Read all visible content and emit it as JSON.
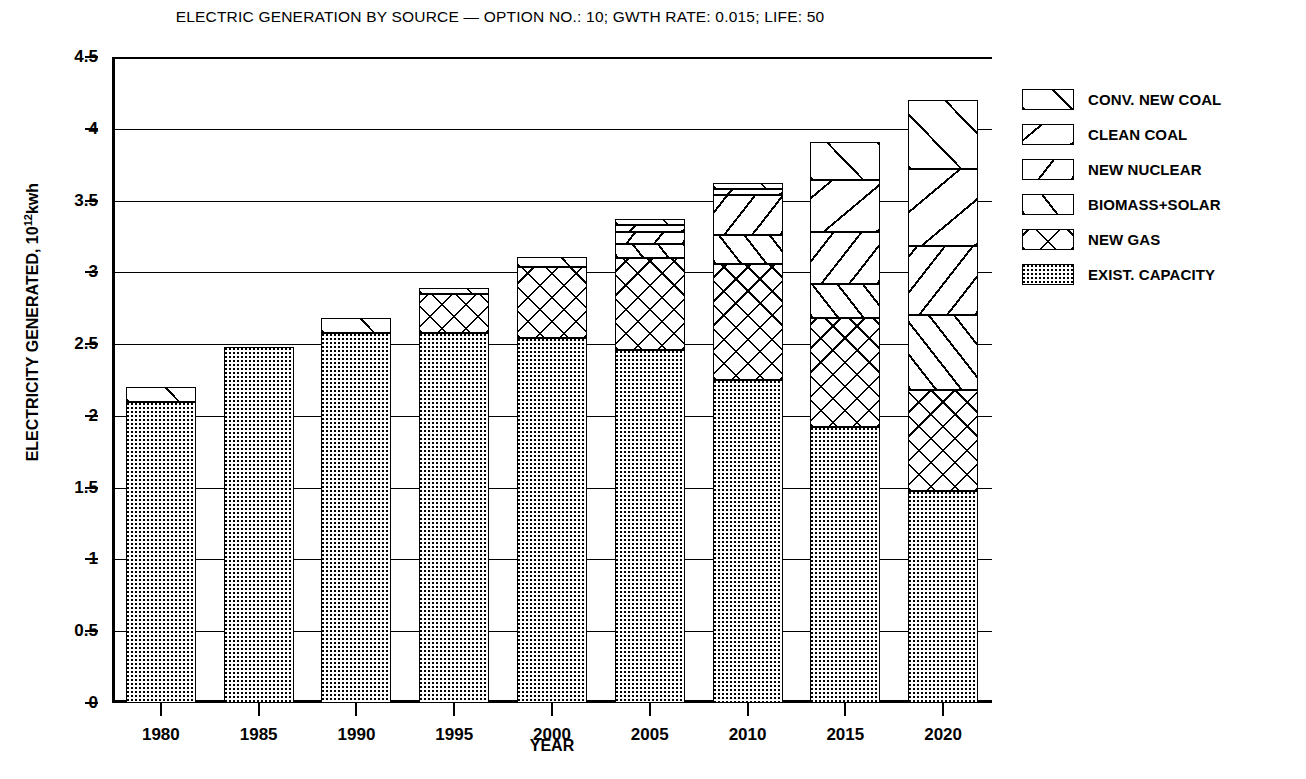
{
  "chart_data": {
    "type": "bar",
    "stacked": true,
    "title": "ELECTRIC GENERATION BY SOURCE — OPTION NO.: 10; GWTH RATE: 0.015; LIFE: 50",
    "xlabel": "YEAR",
    "ylabel": "ELECTRICITY GENERATED, 10¹12kwh",
    "ylabel_prefix": "ELECTRICITY GENERATED, 10",
    "ylabel_exponent": "12",
    "ylabel_suffix": "kwh",
    "categories": [
      "1980",
      "1985",
      "1990",
      "1995",
      "2000",
      "2005",
      "2010",
      "2015",
      "2020"
    ],
    "ylim": [
      0,
      4.5
    ],
    "ytick_labels": [
      "0",
      "0.5",
      "1",
      "1.5",
      "2",
      "2.5",
      "3",
      "3.5",
      "4",
      "4.5"
    ],
    "ytick_values": [
      0,
      0.5,
      1,
      1.5,
      2,
      2.5,
      3,
      3.5,
      4,
      4.5
    ],
    "grid": "horizontal",
    "legend_position": "right",
    "series": [
      {
        "name": "EXIST. CAPACITY",
        "fill": "dotted",
        "values": [
          2.1,
          2.48,
          2.58,
          2.58,
          2.54,
          2.46,
          2.25,
          1.92,
          1.48
        ]
      },
      {
        "name": "NEW GAS",
        "fill": "cross-hatch",
        "values": [
          0.0,
          0.0,
          0.0,
          0.27,
          0.5,
          0.64,
          0.81,
          0.76,
          0.7
        ]
      },
      {
        "name": "BIOMASS+SOLAR",
        "fill": "diagonal-up",
        "values": [
          0.0,
          0.0,
          0.0,
          0.0,
          0.0,
          0.1,
          0.2,
          0.24,
          0.52
        ]
      },
      {
        "name": "NEW NUCLEAR",
        "fill": "diagonal-down",
        "values": [
          0.0,
          0.0,
          0.0,
          0.0,
          0.0,
          0.08,
          0.28,
          0.36,
          0.48
        ]
      },
      {
        "name": "CLEAN COAL",
        "fill": "slash-down",
        "values": [
          0.0,
          0.0,
          0.0,
          0.0,
          0.0,
          0.05,
          0.04,
          0.36,
          0.54
        ]
      },
      {
        "name": "CONV. NEW COAL",
        "fill": "slash-up",
        "values": [
          0.1,
          0.0,
          0.1,
          0.04,
          0.07,
          0.04,
          0.04,
          0.27,
          0.48
        ]
      }
    ],
    "totals": [
      2.1,
      2.48,
      2.68,
      2.89,
      3.11,
      3.37,
      3.62,
      3.91,
      4.2
    ]
  },
  "legend": {
    "items": [
      {
        "label": "CONV. NEW COAL",
        "swatch": "sw-convcoal"
      },
      {
        "label": "CLEAN COAL",
        "swatch": "sw-cleancoal"
      },
      {
        "label": "NEW NUCLEAR",
        "swatch": "sw-nuclear"
      },
      {
        "label": "BIOMASS+SOLAR",
        "swatch": "sw-biosolar"
      },
      {
        "label": "NEW GAS",
        "swatch": "sw-gas"
      },
      {
        "label": "EXIST. CAPACITY",
        "swatch": "sw-exist"
      }
    ]
  },
  "colors": {
    "ink": "#000000",
    "paper": "#ffffff"
  }
}
